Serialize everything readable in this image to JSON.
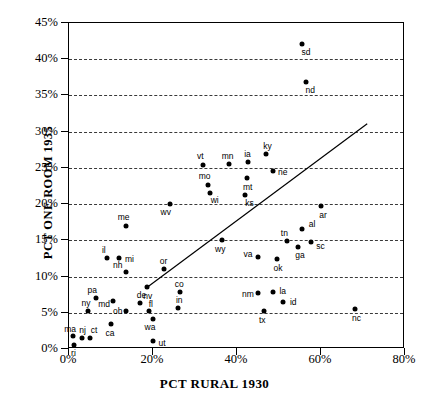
{
  "chart_data": {
    "type": "scatter",
    "title": "",
    "xlabel": "PCT RURAL 1930",
    "ylabel": "PCT ONE ROOM 1935",
    "xlim": [
      0,
      80
    ],
    "ylim": [
      0,
      45
    ],
    "xticks": [
      "0%",
      "20%",
      "40%",
      "60%",
      "80%"
    ],
    "xtick_values": [
      0,
      20,
      40,
      60,
      80
    ],
    "yticks": [
      "0%",
      "5%",
      "10%",
      "15%",
      "20%",
      "25%",
      "30%",
      "35%",
      "40%",
      "45%"
    ],
    "ytick_values": [
      0,
      5,
      10,
      15,
      20,
      25,
      30,
      35,
      40,
      45
    ],
    "grid": "horizontal-dashed",
    "legend": "none",
    "points": [
      {
        "label": "sd",
        "x": 55.5,
        "y": 42.1,
        "lx": 4,
        "ly": 8
      },
      {
        "label": "nd",
        "x": 56.5,
        "y": 36.9,
        "lx": 4,
        "ly": 8
      },
      {
        "label": "ky",
        "x": 47.0,
        "y": 26.9,
        "lx": 1,
        "ly": -8
      },
      {
        "label": "ia",
        "x": 42.5,
        "y": 25.8,
        "lx": 0,
        "ly": -8
      },
      {
        "label": "mn",
        "x": 38.0,
        "y": 25.5,
        "lx": -1,
        "ly": -8
      },
      {
        "label": "vt",
        "x": 32.0,
        "y": 25.4,
        "lx": -3,
        "ly": -9
      },
      {
        "label": "ne",
        "x": 48.5,
        "y": 24.6,
        "lx": 10,
        "ly": 1
      },
      {
        "label": "mt",
        "x": 42.3,
        "y": 23.6,
        "lx": 1,
        "ly": 9
      },
      {
        "label": "mo",
        "x": 33.0,
        "y": 22.6,
        "lx": -3,
        "ly": -9
      },
      {
        "label": "wi",
        "x": 33.5,
        "y": 21.6,
        "lx": 5,
        "ly": 7
      },
      {
        "label": "ks",
        "x": 42.0,
        "y": 21.3,
        "lx": 4,
        "ly": 8
      },
      {
        "label": "ar",
        "x": 60.0,
        "y": 19.8,
        "lx": 2,
        "ly": 9
      },
      {
        "label": "wv",
        "x": 24.0,
        "y": 20.0,
        "lx": -4,
        "ly": 8
      },
      {
        "label": "me",
        "x": 13.5,
        "y": 17.0,
        "lx": -2,
        "ly": -9
      },
      {
        "label": "al",
        "x": 55.5,
        "y": 16.5,
        "lx": 10,
        "ly": -5
      },
      {
        "label": "tn",
        "x": 52.0,
        "y": 14.9,
        "lx": -3,
        "ly": -8
      },
      {
        "label": "sc",
        "x": 57.5,
        "y": 14.8,
        "lx": 10,
        "ly": 4
      },
      {
        "label": "ga",
        "x": 54.5,
        "y": 14.1,
        "lx": 2,
        "ly": 8
      },
      {
        "label": "wy",
        "x": 36.5,
        "y": 15.0,
        "lx": -2,
        "ly": 9
      },
      {
        "label": "mi",
        "x": 12.0,
        "y": 12.5,
        "lx": 10,
        "ly": 1
      },
      {
        "label": "il",
        "x": 9.0,
        "y": 12.5,
        "lx": -3,
        "ly": -8
      },
      {
        "label": "va",
        "x": 45.0,
        "y": 12.7,
        "lx": -10,
        "ly": -3
      },
      {
        "label": "ok",
        "x": 49.5,
        "y": 12.4,
        "lx": 1,
        "ly": 9
      },
      {
        "label": "nh",
        "x": 13.5,
        "y": 10.6,
        "lx": -8,
        "ly": -7
      },
      {
        "label": "or",
        "x": 22.5,
        "y": 11.0,
        "lx": 0,
        "ly": -8
      },
      {
        "label": "nv",
        "x": 18.5,
        "y": 8.5,
        "lx": 1,
        "ly": 9
      },
      {
        "label": "co",
        "x": 26.5,
        "y": 7.8,
        "lx": -1,
        "ly": -8
      },
      {
        "label": "la",
        "x": 48.5,
        "y": 7.8,
        "lx": 10,
        "ly": -1
      },
      {
        "label": "nm",
        "x": 45.0,
        "y": 7.7,
        "lx": -10,
        "ly": 1
      },
      {
        "label": "pa",
        "x": 6.5,
        "y": 7.0,
        "lx": -4,
        "ly": -8
      },
      {
        "label": "md",
        "x": 10.5,
        "y": 6.6,
        "lx": -9,
        "ly": 3
      },
      {
        "label": "de",
        "x": 17.0,
        "y": 6.3,
        "lx": 1,
        "ly": -8
      },
      {
        "label": "id",
        "x": 51.0,
        "y": 6.5,
        "lx": 10,
        "ly": 0
      },
      {
        "label": "in",
        "x": 26.0,
        "y": 5.7,
        "lx": 1,
        "ly": -8
      },
      {
        "label": "ny",
        "x": 4.5,
        "y": 5.3,
        "lx": -2,
        "ly": -8
      },
      {
        "label": "oh",
        "x": 13.5,
        "y": 5.2,
        "lx": -8,
        "ly": 0
      },
      {
        "label": "fl",
        "x": 19.0,
        "y": 5.2,
        "lx": 2,
        "ly": -7
      },
      {
        "label": "tx",
        "x": 46.5,
        "y": 5.2,
        "lx": -2,
        "ly": 9
      },
      {
        "label": "nc",
        "x": 68.0,
        "y": 5.5,
        "lx": 2,
        "ly": 9
      },
      {
        "label": "wa",
        "x": 20.0,
        "y": 4.1,
        "lx": -3,
        "ly": 8
      },
      {
        "label": "ca",
        "x": 10.0,
        "y": 3.4,
        "lx": -1,
        "ly": 9
      },
      {
        "label": "ut",
        "x": 20.0,
        "y": 1.1,
        "lx": 9,
        "ly": 2
      },
      {
        "label": "ma",
        "x": 1.0,
        "y": 1.8,
        "lx": -3,
        "ly": -7
      },
      {
        "label": "nj",
        "x": 3.0,
        "y": 1.5,
        "lx": 1,
        "ly": -8
      },
      {
        "label": "ct",
        "x": 5.0,
        "y": 1.5,
        "lx": 4,
        "ly": -8
      },
      {
        "label": "ri",
        "x": 1.3,
        "y": 0.6,
        "lx": -1,
        "ly": 8
      }
    ],
    "trendline": {
      "x1": 18.3,
      "y1": 8.4,
      "x2": 71.0,
      "y2": 31.1,
      "color": "#000000"
    }
  },
  "style": {
    "point_color": "#000000",
    "grid_color": "#3a3a3a",
    "axis_color": "#000000",
    "background": "#ffffff"
  }
}
